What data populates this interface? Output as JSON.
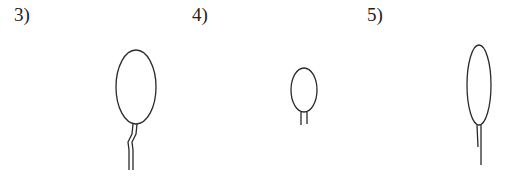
{
  "figures": [
    {
      "label": "3)",
      "shape": "oval-with-bent-double-stem"
    },
    {
      "label": "4)",
      "shape": "small-oval-with-short-double-stem"
    },
    {
      "label": "5)",
      "shape": "narrow-tall-oval-with-single-stem"
    }
  ],
  "colors": {
    "stroke": "#2a2a2a",
    "background": "#ffffff"
  }
}
